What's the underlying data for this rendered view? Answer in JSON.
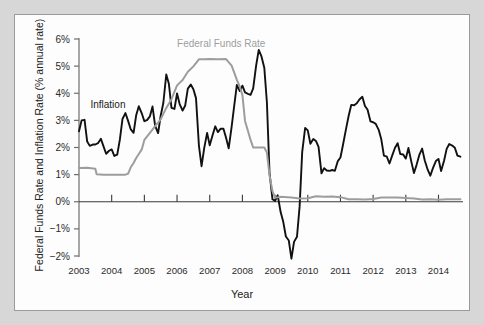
{
  "chart_data": {
    "type": "line",
    "title": "",
    "xlabel": "Year",
    "ylabel": "Federal Funds Rate and Inflation Rate (% annual rate)",
    "xlim": [
      2003.0,
      2014.75
    ],
    "ylim": [
      -2,
      6
    ],
    "grid": false,
    "legend_position": "in-plot annotations",
    "ytick_labels": [
      "6%",
      "5%",
      "4%",
      "3%",
      "2%",
      "1%",
      "0%",
      "-1%",
      "-2%"
    ],
    "ytick_values": [
      6,
      5,
      4,
      3,
      2,
      1,
      0,
      -1,
      -2
    ],
    "xtick_labels": [
      "2003",
      "2004",
      "2005",
      "2006",
      "2007",
      "2008",
      "2009",
      "2010",
      "2011",
      "2012",
      "2013",
      "2014"
    ],
    "xtick_values": [
      2003,
      2004,
      2005,
      2006,
      2007,
      2008,
      2009,
      2010,
      2011,
      2012,
      2013,
      2014
    ],
    "annotations": [
      {
        "text": "Federal Funds Rate",
        "x": 2006.0,
        "y": 5.7,
        "color": "#9d9d9d"
      },
      {
        "text": "Inflation",
        "x": 2003.35,
        "y": 3.45,
        "color": "#1a1a1a"
      }
    ],
    "series": [
      {
        "name": "Inflation",
        "color": "#111111",
        "x": [
          2003.0,
          2003.08,
          2003.17,
          2003.25,
          2003.33,
          2003.42,
          2003.5,
          2003.58,
          2003.67,
          2003.75,
          2003.83,
          2003.92,
          2004.0,
          2004.08,
          2004.17,
          2004.25,
          2004.33,
          2004.42,
          2004.5,
          2004.58,
          2004.67,
          2004.75,
          2004.83,
          2004.92,
          2005.0,
          2005.08,
          2005.17,
          2005.25,
          2005.33,
          2005.42,
          2005.5,
          2005.58,
          2005.67,
          2005.75,
          2005.83,
          2005.92,
          2006.0,
          2006.08,
          2006.17,
          2006.25,
          2006.33,
          2006.42,
          2006.5,
          2006.58,
          2006.67,
          2006.75,
          2006.83,
          2006.92,
          2007.0,
          2007.08,
          2007.17,
          2007.25,
          2007.33,
          2007.42,
          2007.5,
          2007.58,
          2007.67,
          2007.75,
          2007.83,
          2007.92,
          2008.0,
          2008.08,
          2008.17,
          2008.25,
          2008.33,
          2008.42,
          2008.5,
          2008.58,
          2008.67,
          2008.75,
          2008.83,
          2008.92,
          2009.0,
          2009.08,
          2009.17,
          2009.25,
          2009.33,
          2009.42,
          2009.5,
          2009.58,
          2009.67,
          2009.75,
          2009.83,
          2009.92,
          2010.0,
          2010.08,
          2010.17,
          2010.25,
          2010.33,
          2010.42,
          2010.5,
          2010.58,
          2010.67,
          2010.75,
          2010.83,
          2010.92,
          2011.0,
          2011.08,
          2011.17,
          2011.25,
          2011.33,
          2011.42,
          2011.5,
          2011.58,
          2011.67,
          2011.75,
          2011.83,
          2011.92,
          2012.0,
          2012.08,
          2012.17,
          2012.25,
          2012.33,
          2012.42,
          2012.5,
          2012.58,
          2012.67,
          2012.75,
          2012.83,
          2012.92,
          2013.0,
          2013.08,
          2013.17,
          2013.25,
          2013.33,
          2013.42,
          2013.5,
          2013.58,
          2013.67,
          2013.75,
          2013.83,
          2013.92,
          2014.0,
          2014.08,
          2014.17,
          2014.25,
          2014.33,
          2014.42,
          2014.5,
          2014.58,
          2014.67
        ],
        "y": [
          2.6,
          3.0,
          3.02,
          2.22,
          2.06,
          2.11,
          2.11,
          2.16,
          2.32,
          2.04,
          1.77,
          1.88,
          1.93,
          1.69,
          1.74,
          2.29,
          3.05,
          3.27,
          2.99,
          2.68,
          2.54,
          3.19,
          3.52,
          3.26,
          2.97,
          3.01,
          3.15,
          3.51,
          2.8,
          2.53,
          3.17,
          3.64,
          4.69,
          4.35,
          3.46,
          3.42,
          3.99,
          3.6,
          3.36,
          3.55,
          4.17,
          4.32,
          4.15,
          3.82,
          2.06,
          1.31,
          1.97,
          2.54,
          2.08,
          2.42,
          2.78,
          2.57,
          2.69,
          2.69,
          2.36,
          1.97,
          2.76,
          3.54,
          4.31,
          4.08,
          4.28,
          4.03,
          3.98,
          3.94,
          4.18,
          5.02,
          5.6,
          5.37,
          4.94,
          3.66,
          1.07,
          0.09,
          0.03,
          0.24,
          -0.38,
          -0.74,
          -1.28,
          -1.43,
          -2.1,
          -1.48,
          -1.29,
          -0.18,
          1.84,
          2.72,
          2.63,
          2.14,
          2.31,
          2.24,
          2.02,
          1.05,
          1.24,
          1.15,
          1.14,
          1.17,
          1.14,
          1.5,
          1.63,
          2.11,
          2.68,
          3.16,
          3.57,
          3.56,
          3.63,
          3.77,
          3.87,
          3.53,
          3.39,
          2.96,
          2.93,
          2.87,
          2.65,
          2.3,
          1.7,
          1.66,
          1.41,
          1.69,
          1.99,
          2.16,
          1.76,
          1.74,
          1.59,
          1.98,
          1.47,
          1.06,
          1.36,
          1.75,
          1.96,
          1.52,
          1.18,
          0.96,
          1.24,
          1.5,
          1.58,
          1.13,
          1.51,
          1.95,
          2.13,
          2.07,
          1.99,
          1.7,
          1.66
        ]
      },
      {
        "name": "Federal Funds Rate",
        "color": "#9d9d9d",
        "x": [
          2003.0,
          2003.25,
          2003.5,
          2003.54,
          2003.75,
          2004.0,
          2004.25,
          2004.42,
          2004.5,
          2004.58,
          2004.67,
          2004.75,
          2004.83,
          2004.92,
          2005.0,
          2005.17,
          2005.33,
          2005.5,
          2005.67,
          2005.83,
          2006.0,
          2006.17,
          2006.33,
          2006.5,
          2006.67,
          2006.83,
          2007.0,
          2007.25,
          2007.5,
          2007.67,
          2007.75,
          2007.83,
          2007.92,
          2008.0,
          2008.08,
          2008.17,
          2008.25,
          2008.33,
          2008.5,
          2008.67,
          2008.75,
          2008.83,
          2008.92,
          2009.0,
          2009.17,
          2009.5,
          2009.75,
          2010.0,
          2010.25,
          2010.5,
          2010.75,
          2011.0,
          2011.25,
          2011.5,
          2011.75,
          2012.0,
          2012.25,
          2012.5,
          2012.75,
          2013.0,
          2013.25,
          2013.5,
          2013.75,
          2014.0,
          2014.25,
          2014.5,
          2014.67
        ],
        "y": [
          1.24,
          1.25,
          1.22,
          1.01,
          1.0,
          1.0,
          1.0,
          1.0,
          1.03,
          1.26,
          1.43,
          1.61,
          1.76,
          1.93,
          2.28,
          2.54,
          2.79,
          3.04,
          3.46,
          3.78,
          4.29,
          4.49,
          4.79,
          4.99,
          5.25,
          5.25,
          5.26,
          5.25,
          5.26,
          5.02,
          4.76,
          4.49,
          4.24,
          3.94,
          2.98,
          2.61,
          2.28,
          2.0,
          2.0,
          2.0,
          1.81,
          0.97,
          0.39,
          0.15,
          0.18,
          0.16,
          0.12,
          0.13,
          0.2,
          0.18,
          0.19,
          0.17,
          0.09,
          0.09,
          0.08,
          0.1,
          0.16,
          0.16,
          0.16,
          0.14,
          0.12,
          0.08,
          0.09,
          0.07,
          0.09,
          0.09,
          0.09
        ]
      }
    ]
  },
  "axis": {
    "ylabel_text": "Federal Funds Rate and Inflation Rate (% annual rate)",
    "xlabel_text": "Year"
  }
}
